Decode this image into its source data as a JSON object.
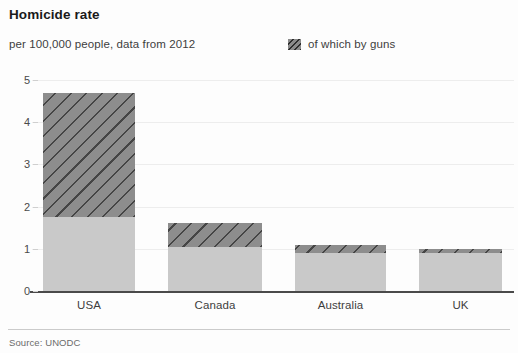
{
  "header": {
    "title": "Homicide rate",
    "subtitle": "per 100,000 people, data from 2012"
  },
  "legend": {
    "swatch_name": "hatched-swatch-icon",
    "label": "of which by guns"
  },
  "footer": {
    "source": "Source: UNODC"
  },
  "chart_data": {
    "type": "bar",
    "title": "Homicide rate",
    "subtitle": "per 100,000 people, data from 2012",
    "xlabel": "",
    "ylabel": "",
    "ylim": [
      0,
      5
    ],
    "yticks": [
      "0",
      "1",
      "2",
      "3",
      "4",
      "5"
    ],
    "grid": true,
    "stacked": true,
    "legend_position": "top-right",
    "categories": [
      "USA",
      "Canada",
      "Australia",
      "UK"
    ],
    "series": [
      {
        "name": "of which by guns",
        "color": "#8d8d8d",
        "hatched": true,
        "values": [
          1.75,
          1.05,
          0.9,
          0.9
        ]
      },
      {
        "name": "other homicides",
        "color": "#c9c9c9",
        "hatched": false,
        "values": [
          2.95,
          0.55,
          0.2,
          0.1
        ]
      }
    ],
    "totals": [
      4.7,
      1.6,
      1.1,
      1.0
    ]
  },
  "bars": [
    {
      "label": "USA",
      "total": 4.7,
      "guns": 1.75,
      "left": 43,
      "width": 92
    },
    {
      "label": "Canada",
      "total": 1.6,
      "guns": 1.05,
      "left": 168,
      "width": 94
    },
    {
      "label": "Australia",
      "total": 1.1,
      "guns": 0.9,
      "left": 295,
      "width": 91
    },
    {
      "label": "UK",
      "total": 1.0,
      "guns": 0.9,
      "left": 419,
      "width": 83
    }
  ]
}
